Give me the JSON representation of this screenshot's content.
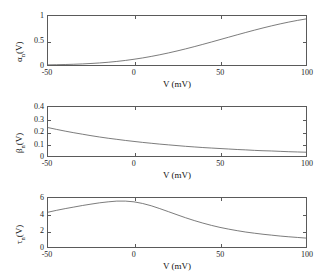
{
  "figure": {
    "background": "#ffffff",
    "line_color": "#5a5a5a",
    "axis_color": "#5a5a5a",
    "text_color": "#111111"
  },
  "chart_data": [
    {
      "type": "line",
      "id": "alpha-n",
      "title": "",
      "xlabel": "V (mV)",
      "ylabel": "α",
      "ylabel_sub": "n",
      "ylabel_suffix": "(V)",
      "ylabel_full": "αn(V)",
      "xlim": [
        -50,
        100
      ],
      "ylim": [
        0,
        1
      ],
      "xticks": [
        -50,
        0,
        50,
        100
      ],
      "xticklabels": [
        "-50",
        "0",
        "50",
        "100"
      ],
      "yticks": [
        0,
        0.5,
        1
      ],
      "yticklabels": [
        "0",
        "0.5",
        "1"
      ],
      "grid": false,
      "legend": false,
      "x": [
        -50,
        -45,
        -40,
        -35,
        -30,
        -25,
        -20,
        -15,
        -10,
        -5,
        0,
        5,
        10,
        15,
        20,
        25,
        30,
        35,
        40,
        45,
        50,
        55,
        60,
        65,
        70,
        75,
        80,
        85,
        90,
        95,
        100
      ],
      "y": [
        0.003,
        0.006,
        0.01,
        0.015,
        0.022,
        0.031,
        0.042,
        0.056,
        0.073,
        0.093,
        0.117,
        0.144,
        0.175,
        0.209,
        0.246,
        0.286,
        0.329,
        0.374,
        0.421,
        0.469,
        0.518,
        0.567,
        0.616,
        0.664,
        0.711,
        0.756,
        0.799,
        0.839,
        0.876,
        0.91,
        0.94
      ]
    },
    {
      "type": "line",
      "id": "beta-n",
      "title": "",
      "xlabel": "V (mV)",
      "ylabel": "β",
      "ylabel_sub": "n",
      "ylabel_suffix": "(V)",
      "ylabel_full": "βn(V)",
      "xlim": [
        -50,
        100
      ],
      "ylim": [
        0,
        0.4
      ],
      "xticks": [
        -50,
        0,
        50,
        100
      ],
      "xticklabels": [
        "-50",
        "0",
        "50",
        "100"
      ],
      "yticks": [
        0,
        0.1,
        0.2,
        0.3,
        0.4
      ],
      "yticklabels": [
        "0",
        "0.1",
        "0.2",
        "0.3",
        "0.4"
      ],
      "grid": false,
      "legend": false,
      "x": [
        -50,
        -45,
        -40,
        -35,
        -30,
        -25,
        -20,
        -15,
        -10,
        -5,
        0,
        5,
        10,
        15,
        20,
        25,
        30,
        35,
        40,
        45,
        50,
        55,
        60,
        65,
        70,
        75,
        80,
        85,
        90,
        95,
        100
      ],
      "y": [
        0.232,
        0.217,
        0.203,
        0.19,
        0.178,
        0.166,
        0.155,
        0.145,
        0.136,
        0.127,
        0.119,
        0.111,
        0.104,
        0.097,
        0.091,
        0.085,
        0.079,
        0.074,
        0.069,
        0.065,
        0.061,
        0.057,
        0.053,
        0.05,
        0.046,
        0.043,
        0.041,
        0.038,
        0.035,
        0.033,
        0.031
      ]
    },
    {
      "type": "line",
      "id": "tau-n",
      "title": "",
      "xlabel": "V (mV)",
      "ylabel": "τ",
      "ylabel_sub": "n",
      "ylabel_suffix": "(V)",
      "ylabel_full": "τn(V)",
      "xlim": [
        -50,
        100
      ],
      "ylim": [
        0,
        6
      ],
      "xticks": [
        -50,
        0,
        50,
        100
      ],
      "xticklabels": [
        "-50",
        "0",
        "50",
        "100"
      ],
      "yticks": [
        0,
        2,
        4,
        6
      ],
      "yticklabels": [
        "0",
        "2",
        "4",
        "6"
      ],
      "grid": false,
      "legend": false,
      "x": [
        -50,
        -45,
        -40,
        -35,
        -30,
        -25,
        -20,
        -15,
        -10,
        -5,
        0,
        5,
        10,
        15,
        20,
        25,
        30,
        35,
        40,
        45,
        50,
        55,
        60,
        65,
        70,
        75,
        80,
        85,
        90,
        95,
        100
      ],
      "y": [
        4.26,
        4.49,
        4.7,
        4.89,
        5.08,
        5.25,
        5.41,
        5.53,
        5.62,
        5.62,
        5.53,
        5.33,
        5.05,
        4.7,
        4.33,
        3.95,
        3.58,
        3.24,
        2.93,
        2.65,
        2.4,
        2.19,
        2.0,
        1.83,
        1.69,
        1.56,
        1.45,
        1.34,
        1.25,
        1.17,
        1.09
      ]
    }
  ]
}
